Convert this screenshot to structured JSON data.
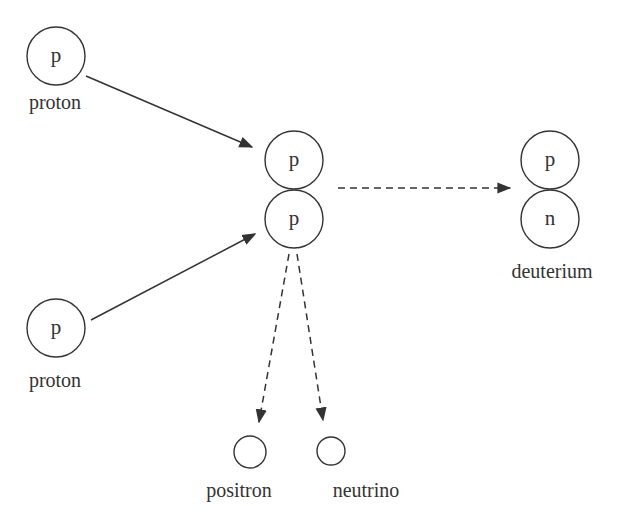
{
  "diagram": {
    "title": "",
    "nodes": {
      "proton_top": {
        "letter": "p",
        "label": "proton"
      },
      "proton_bottom": {
        "letter": "p",
        "label": "proton"
      },
      "pair_top": {
        "letter": "p"
      },
      "pair_bottom": {
        "letter": "p"
      },
      "deuterium_top": {
        "letter": "p"
      },
      "deuterium_bottom": {
        "letter": "n"
      },
      "deuterium": {
        "label": "deuterium"
      },
      "positron": {
        "label": "positron"
      },
      "neutrino": {
        "label": "neutrino"
      }
    },
    "edges": [
      {
        "from": "proton_top",
        "to": "pair",
        "style": "solid"
      },
      {
        "from": "proton_bottom",
        "to": "pair",
        "style": "solid"
      },
      {
        "from": "pair",
        "to": "deuterium",
        "style": "dashed"
      },
      {
        "from": "pair",
        "to": "positron",
        "style": "dashed"
      },
      {
        "from": "pair",
        "to": "neutrino",
        "style": "dashed"
      }
    ],
    "colors": {
      "stroke": "#333333",
      "background": "#ffffff"
    }
  }
}
